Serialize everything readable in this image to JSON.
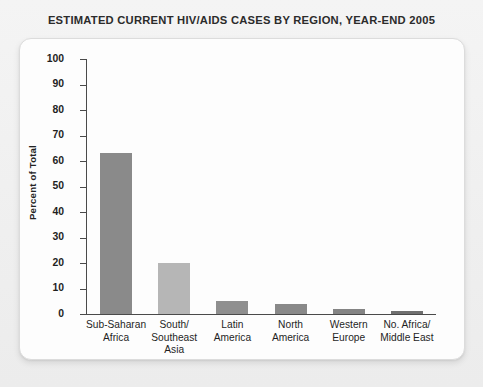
{
  "chart_data": {
    "type": "bar",
    "title": "ESTIMATED CURRENT HIV/AIDS CASES BY REGION, YEAR-END 2005",
    "xlabel": "",
    "ylabel": "Percent of Total",
    "ylim": [
      0,
      100
    ],
    "ytick_step": 10,
    "yticks": [
      "100",
      "90",
      "80",
      "70",
      "60",
      "50",
      "40",
      "30",
      "20",
      "10",
      "0"
    ],
    "grid": false,
    "legend": false,
    "categories": [
      "Sub-Saharan\nAfrica",
      "South/\nSoutheast\nAsia",
      "Latin\nAmerica",
      "North\nAmerica",
      "Western\nEurope",
      "No. Africa/\nMiddle East"
    ],
    "category_lines": [
      [
        "Sub-Saharan",
        "Africa"
      ],
      [
        "South/",
        "Southeast",
        "Asia"
      ],
      [
        "Latin",
        "America"
      ],
      [
        "North",
        "America"
      ],
      [
        "Western",
        "Europe"
      ],
      [
        "No. Africa/",
        "Middle East"
      ]
    ],
    "values": [
      63,
      20,
      5,
      4,
      2,
      1
    ],
    "bar_colors": [
      "#8a8a8a",
      "#b6b6b6",
      "#8f8f8f",
      "#898989",
      "#848484",
      "#6f6f6f"
    ]
  },
  "colors": {
    "page_background": "#f1f1f1",
    "card_background": "#fdfdfd",
    "card_border": "#dcdcdc",
    "axis": "#4a4a4a",
    "text": "#1f1f1f",
    "title_text": "#2b2b2b"
  }
}
